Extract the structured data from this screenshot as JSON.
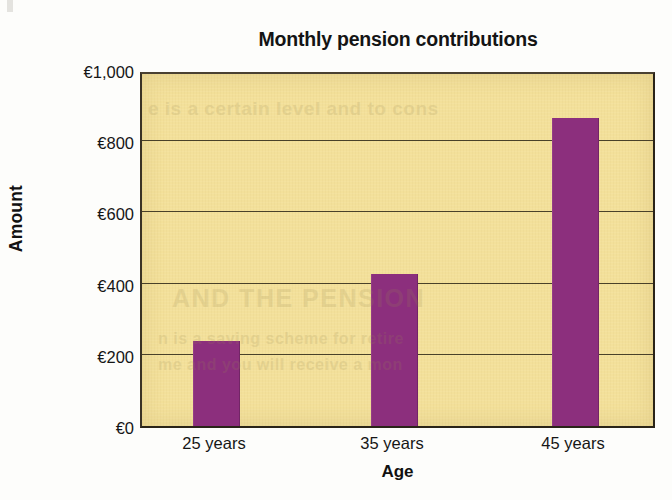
{
  "figure": {
    "title": "Monthly pension contributions",
    "currency_symbol": "€",
    "background_color": "#f3e09a",
    "bar_color": "#8c2f7d",
    "frame_color": "#2a2418",
    "grid_color": "#3b3320"
  },
  "ghost_text": {
    "line1": "e is a certain level and to cons",
    "line2": "AND THE PENSION",
    "line3": "n is a saving scheme for retire",
    "line4": "me and you will receive a mon"
  },
  "chart_data": {
    "type": "bar",
    "title": "Monthly pension contributions",
    "xlabel": "Age",
    "ylabel": "Amount",
    "categories": [
      "25 years",
      "35 years",
      "45 years"
    ],
    "values": [
      240,
      428,
      865
    ],
    "ylim": [
      0,
      1000
    ],
    "ytick_values": [
      0,
      200,
      400,
      600,
      800,
      1000
    ],
    "ytick_labels": [
      "€0",
      "€200",
      "€400",
      "€600",
      "€800",
      "€1,000"
    ],
    "grid": "horizontal",
    "legend": "none",
    "series": [
      {
        "name": "Monthly pension contribution",
        "values": [
          240,
          428,
          865
        ],
        "color": "#8c2f7d"
      }
    ]
  }
}
